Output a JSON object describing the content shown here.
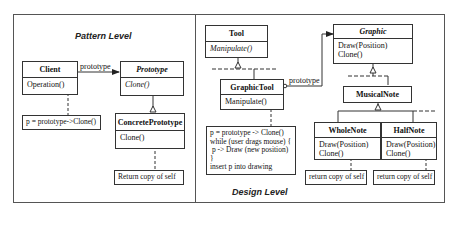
{
  "pattern_level": {
    "title": "Pattern Level",
    "client": {
      "name": "Client",
      "method": "Operation()"
    },
    "association_label": "prototype",
    "prototype": {
      "name": "Prototype",
      "method": "Clone()"
    },
    "concrete_prototype": {
      "name": "ConcretePrototype",
      "method": "Clone()"
    },
    "client_note": "p = prototype->Clone()",
    "concrete_note": "Return copy of self"
  },
  "design_level": {
    "title": "Design Level",
    "tool": {
      "name": "Tool",
      "method": "Manipulate()"
    },
    "graphic_tool": {
      "name": "GraphicTool",
      "method": "Manipulate()"
    },
    "association_label": "prototype",
    "graphic": {
      "name": "Graphic",
      "methods": [
        "Draw(Position)",
        "Clone()"
      ]
    },
    "musical_note": {
      "name": "MusicalNote"
    },
    "whole_note": {
      "name": "WholeNote",
      "methods": [
        "Draw(Position)",
        "Clone()"
      ]
    },
    "half_note": {
      "name": "HalfNote",
      "methods": [
        "Draw(Position)",
        "Clone()"
      ]
    },
    "graphic_tool_note": [
      "p = prototype -> Clone()",
      "while (user drags mouse) {",
      " p -> Draw (new position)",
      "}",
      "insert p into drawing"
    ],
    "whole_note_note": "return copy of self",
    "half_note_note": "return copy of self"
  }
}
